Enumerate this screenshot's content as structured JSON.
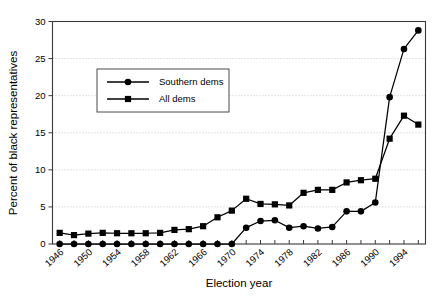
{
  "figure": {
    "background": "#ffffff",
    "ink_color": "#000000",
    "frame_color": "#3a3a3a",
    "grid_color": "#b9b9b9"
  },
  "chart_data": {
    "type": "line",
    "title": "",
    "xlabel": "Election year",
    "ylabel": "Percent of black representatives",
    "xlim": [
      1945,
      1997
    ],
    "ylim": [
      0,
      30
    ],
    "ytick_values": [
      0,
      5,
      10,
      15,
      20,
      25,
      30
    ],
    "ytick_labels": [
      "0",
      "5",
      "10",
      "15",
      "20",
      "25",
      "30"
    ],
    "x": [
      1946,
      1948,
      1950,
      1952,
      1954,
      1956,
      1958,
      1960,
      1962,
      1964,
      1966,
      1968,
      1970,
      1972,
      1974,
      1976,
      1978,
      1980,
      1982,
      1984,
      1986,
      1988,
      1990,
      1992,
      1994,
      1996
    ],
    "xtick_values": [
      1946,
      1948,
      1950,
      1952,
      1954,
      1956,
      1958,
      1960,
      1962,
      1964,
      1966,
      1968,
      1970,
      1972,
      1974,
      1976,
      1978,
      1980,
      1982,
      1984,
      1986,
      1988,
      1990,
      1992,
      1994,
      1996
    ],
    "xtick_labels_shown": [
      1946,
      1950,
      1954,
      1958,
      1962,
      1966,
      1970,
      1974,
      1978,
      1982,
      1986,
      1990,
      1994
    ],
    "grid": "horizontal-dotted",
    "legend_position": "upper-left-inset",
    "series": [
      {
        "name": "Southern dems",
        "marker": "circle",
        "values": [
          0,
          0,
          0,
          0,
          0,
          0,
          0,
          0,
          0,
          0,
          0,
          0,
          0,
          2.2,
          3.1,
          3.2,
          2.2,
          2.4,
          2.1,
          2.3,
          4.4,
          4.4,
          5.6,
          19.8,
          26.3,
          28.8
        ]
      },
      {
        "name": "All dems",
        "marker": "square",
        "values": [
          1.5,
          1.2,
          1.4,
          1.5,
          1.45,
          1.45,
          1.45,
          1.5,
          1.9,
          2.0,
          2.4,
          3.6,
          4.5,
          6.1,
          5.4,
          5.35,
          5.2,
          6.9,
          7.3,
          7.3,
          8.3,
          8.6,
          8.8,
          14.2,
          17.3,
          16.1
        ]
      }
    ]
  },
  "legend": {
    "entries": [
      {
        "label": "Southern dems",
        "marker": "circle"
      },
      {
        "label": "All dems",
        "marker": "square"
      }
    ]
  }
}
